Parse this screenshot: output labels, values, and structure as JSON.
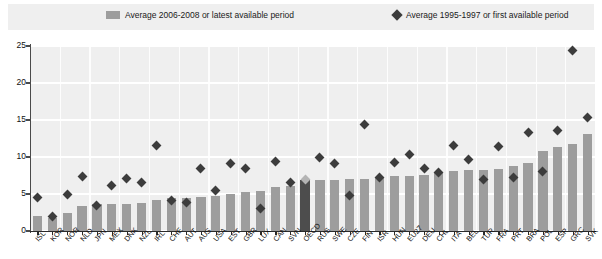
{
  "legend": {
    "series_bar": "Average 2006-2008 or latest available period",
    "series_diamond": "Average 1995-1997 or first available period",
    "bar_icon": "bar-swatch-icon",
    "diamond_icon": "diamond-swatch-icon"
  },
  "axis": {
    "y_ticks": [
      "0",
      "5",
      "10",
      "15",
      "20",
      "25"
    ],
    "y_min": 0,
    "y_max": 25,
    "y_step": 5
  },
  "chart_data": {
    "type": "bar",
    "title": "",
    "subtitle": "",
    "xlabel": "",
    "ylabel": "",
    "ylim": [
      0,
      25
    ],
    "grid": true,
    "legend_position": "top",
    "highlight_category": "OECD",
    "categories": [
      "ISL",
      "KOR",
      "NOR",
      "NLD",
      "JPN",
      "MEX",
      "DNK",
      "NZL",
      "IRL",
      "CHE",
      "AUT",
      "AUS",
      "USA",
      "EST",
      "GBR",
      "LUX",
      "CAN",
      "SVN",
      "OECD",
      "RUS",
      "SWE",
      "CZE",
      "FIN",
      "ISR",
      "HUN",
      "EU27",
      "DEU",
      "CHL",
      "ITA",
      "BEL",
      "TUR",
      "FRA",
      "PRT",
      "BRA",
      "POL",
      "ESP",
      "GRC",
      "SVK"
    ],
    "series": [
      {
        "name": "Average 2006-2008 or latest available period",
        "type": "bar",
        "color": "#9d9d9d",
        "highlight_color": "#4d4d4d",
        "values": [
          2.0,
          1.7,
          2.4,
          3.4,
          3.6,
          3.6,
          3.7,
          3.8,
          4.2,
          4.4,
          4.5,
          4.6,
          4.7,
          5.0,
          5.3,
          5.4,
          6.0,
          6.1,
          6.9,
          6.9,
          6.9,
          7.0,
          7.0,
          7.2,
          7.4,
          7.5,
          7.6,
          7.8,
          8.1,
          8.2,
          8.3,
          8.4,
          8.8,
          9.2,
          10.8,
          11.4,
          11.8,
          13.1
        ]
      },
      {
        "name": "Average 1995-1997 or first available period",
        "type": "scatter",
        "color": "#3c3c3c",
        "highlight_color": "#b4b4b4",
        "values": [
          4.5,
          1.9,
          4.9,
          7.3,
          3.4,
          6.1,
          7.1,
          6.5,
          11.6,
          4.1,
          3.9,
          8.4,
          5.5,
          9.1,
          8.4,
          3.1,
          9.4,
          6.6,
          7.0,
          9.9,
          9.1,
          4.8,
          14.4,
          7.2,
          9.2,
          10.3,
          8.4,
          7.9,
          11.6,
          9.7,
          6.9,
          11.4,
          7.2,
          13.3,
          8.0,
          13.6,
          24.4,
          15.4
        ]
      }
    ]
  }
}
